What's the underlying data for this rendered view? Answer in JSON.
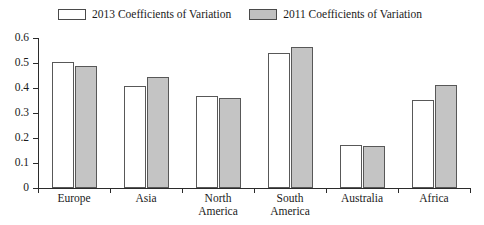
{
  "chart_data": {
    "type": "bar",
    "title": "",
    "subtitle": "",
    "xlabel": "",
    "ylabel": "",
    "grid": false,
    "legend_position": "top",
    "categories": [
      "Europe",
      "Asia",
      "North\nAmerica",
      "South\nAmerica",
      "Australia",
      "Africa"
    ],
    "ylim": [
      0,
      0.6
    ],
    "yticks": [
      "0",
      "0.1",
      "0.2",
      "0.3",
      "0.4",
      "0.5",
      "0.6"
    ],
    "ytick_values": [
      0,
      0.1,
      0.2,
      0.3,
      0.4,
      0.5,
      0.6
    ],
    "series": [
      {
        "name": "2013 Coefficients of Variation",
        "color": "#ffffff",
        "values": [
          0.505,
          0.408,
          0.368,
          0.54,
          0.172,
          0.352
        ]
      },
      {
        "name": "2011 Coefficients of Variation",
        "color": "#c4c4c4",
        "values": [
          0.488,
          0.444,
          0.36,
          0.564,
          0.168,
          0.412
        ]
      }
    ]
  },
  "legend": {
    "items": [
      {
        "label": "2013 Coefficients of Variation",
        "swatch": "white-square-icon"
      },
      {
        "label": "2011 Coefficients of Variation",
        "swatch": "gray-square-icon"
      }
    ]
  }
}
